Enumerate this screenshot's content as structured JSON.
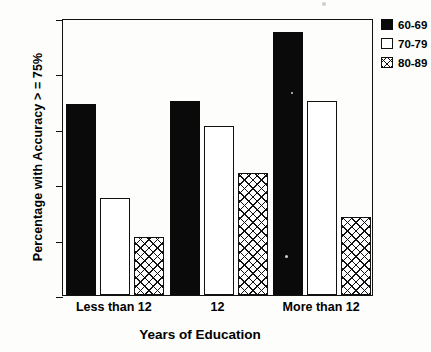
{
  "chart_data": {
    "type": "bar",
    "title": "",
    "xlabel": "Years of Education",
    "ylabel": "Percentage with Accuracy > = 75%",
    "categories": [
      "Less than 12",
      "12",
      "More than 12"
    ],
    "series": [
      {
        "name": "60-69",
        "fill": "solid",
        "values": [
          69,
          70,
          95
        ]
      },
      {
        "name": "70-79",
        "fill": "open",
        "values": [
          35,
          61,
          70
        ]
      },
      {
        "name": "80-89",
        "fill": "hatch",
        "values": [
          21,
          44,
          28
        ]
      }
    ],
    "ylim": [
      0,
      100
    ],
    "yticks": [
      0,
      20,
      40,
      60,
      80,
      100
    ],
    "ytick_labels": [
      "0",
      "20",
      "40",
      "60",
      "80",
      "100"
    ],
    "grid": false,
    "legend_position": "upper right",
    "colors": {
      "axis": "#111111",
      "series_60_69": "#0a0a0a",
      "series_70_79": "#ffffff",
      "series_80_89": "#ffffff",
      "background": "#ffffff"
    }
  },
  "legend": {
    "entries": [
      {
        "label": "60-69",
        "fill": "solid"
      },
      {
        "label": "70-79",
        "fill": "open"
      },
      {
        "label": "80-89",
        "fill": "hatch"
      }
    ]
  }
}
